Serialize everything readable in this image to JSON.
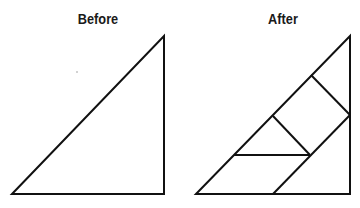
{
  "panels": [
    {
      "title": "Before",
      "title_x": 98
    },
    {
      "title": "After",
      "title_x": 283
    }
  ],
  "colors": {
    "stroke": "#111111",
    "background": "#ffffff"
  },
  "geometry": {
    "before": {
      "triangle": [
        [
          12,
          194
        ],
        [
          164,
          36
        ],
        [
          164,
          194
        ]
      ]
    },
    "after": {
      "triangle": [
        [
          196,
          194
        ],
        [
          350,
          36
        ],
        [
          350,
          194
        ]
      ],
      "inner_lines": [
        [
          [
            311,
            75
          ],
          [
            350,
            115
          ]
        ],
        [
          [
            273,
            116
          ],
          [
            310,
            155
          ]
        ],
        [
          [
            234,
            155
          ],
          [
            310,
            155
          ]
        ],
        [
          [
            350,
            115
          ],
          [
            273,
            194
          ]
        ]
      ]
    }
  }
}
